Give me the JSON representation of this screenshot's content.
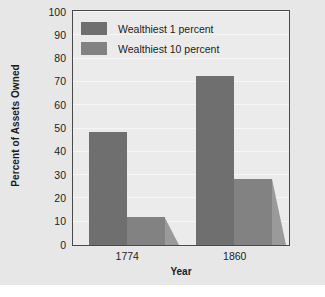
{
  "chart_data": {
    "type": "bar",
    "title": "",
    "xlabel": "Year",
    "ylabel": "Percent of Assets Owned",
    "categories": [
      "1774",
      "1860"
    ],
    "series": [
      {
        "name": "Wealthiest 1 percent",
        "values": [
          48.5,
          72.5
        ],
        "color": "#6f6f6f"
      },
      {
        "name": "Wealthiest 10 percent",
        "values": [
          12,
          28.5
        ],
        "color": "#828282"
      }
    ],
    "ylim": [
      0,
      100
    ],
    "yticks": [
      0,
      10,
      20,
      30,
      40,
      50,
      60,
      70,
      80,
      90,
      100
    ],
    "ytick_labels": [
      "0",
      "10",
      "20",
      "30",
      "40",
      "50",
      "60",
      "70",
      "80",
      "90",
      "100"
    ],
    "grid": true,
    "legend_position": "upper-left-inside"
  },
  "style": {
    "figure_background": "#e7e7e7",
    "plot_background": "#ebebeb",
    "frame_color": "#4a4a4a",
    "gridline_color": "#f6f6f6",
    "text_color": "#1d1d1d"
  }
}
